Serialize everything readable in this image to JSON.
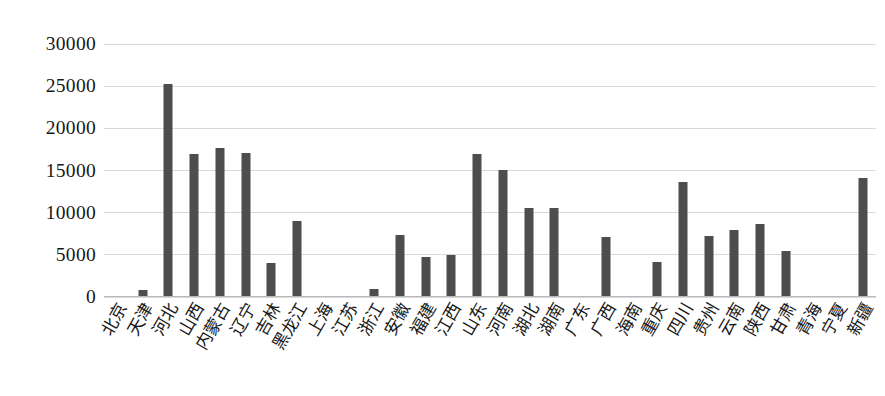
{
  "chart_data": {
    "type": "bar",
    "title": "",
    "subtitle": "",
    "xlabel": "",
    "ylabel": "",
    "ylim": [
      0,
      30000
    ],
    "ytick_step": 5000,
    "yticks": [
      "0",
      "5000",
      "10000",
      "15000",
      "20000",
      "25000",
      "30000"
    ],
    "grid": true,
    "legend": false,
    "legend_position": "none",
    "bar_color": "#4d4d4d",
    "gridline_color": "#d9d9d9",
    "axis_color": "#b9b9b9",
    "categories": [
      "北京",
      "天津",
      "河北",
      "山西",
      "内蒙古",
      "辽宁",
      "吉林",
      "黑龙江",
      "上海",
      "江苏",
      "浙江",
      "安徽",
      "福建",
      "江西",
      "山东",
      "河南",
      "湖北",
      "湖南",
      "广东",
      "广西",
      "海南",
      "重庆",
      "四川",
      "贵州",
      "云南",
      "陕西",
      "甘肃",
      "青海",
      "宁夏",
      "新疆"
    ],
    "values": [
      0,
      800,
      25300,
      17000,
      17700,
      17100,
      4000,
      9000,
      0,
      0,
      1000,
      7300,
      4800,
      5000,
      16900,
      15100,
      10600,
      10600,
      0,
      7100,
      0,
      4200,
      13600,
      7200,
      7900,
      8700,
      5500,
      0,
      0,
      14100
    ]
  }
}
